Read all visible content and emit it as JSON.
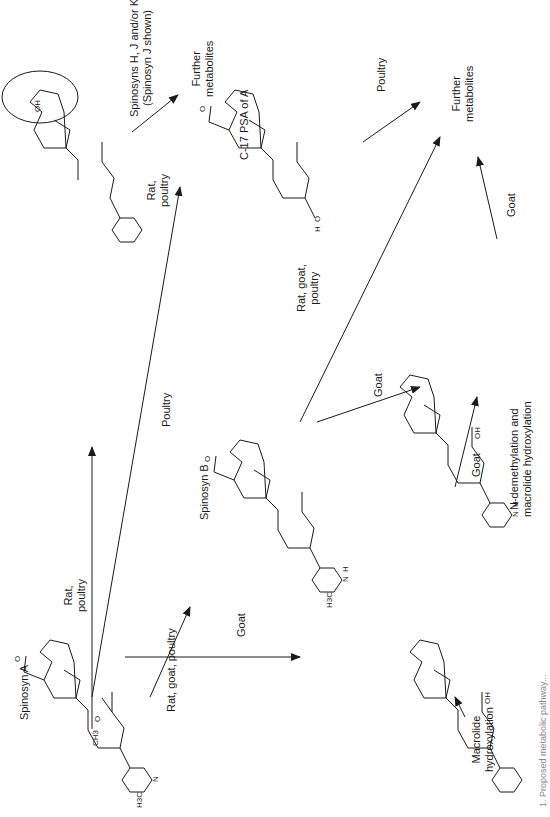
{
  "figure": {
    "orientation": "rotated 90 degrees counter-clockwise",
    "compounds": [
      {
        "id": "spinosyn_a",
        "label": "Spinosyn A"
      },
      {
        "id": "spinosyn_b",
        "label": "Spinosyn B"
      },
      {
        "id": "c17_psa",
        "label": "C-17 PSA of A"
      },
      {
        "id": "spinosyn_hjk",
        "label_line1": "Spinosyns H, J and/or K",
        "label_line2": "(Spinosyn J shown)"
      },
      {
        "id": "macrolide_hydroxylated",
        "label_line1": "Macrolide",
        "label_line2": "hydroxylation"
      },
      {
        "id": "n_demethylated_hydroxylated",
        "label_line1": "N-demethylation and",
        "label_line2": "macrolide hydroxylation"
      }
    ],
    "endpoints": [
      {
        "id": "further_top",
        "line1": "Further",
        "line2": "metabolites"
      },
      {
        "id": "further_right",
        "line1": "Further",
        "line2": "metabolites"
      }
    ],
    "transitions": [
      {
        "from": "spinosyn_a",
        "to": "spinosyn_hjk",
        "line1": "Rat,",
        "line2": "poultry"
      },
      {
        "from": "spinosyn_a",
        "to": "c17_psa",
        "line1": "Poultry",
        "line2": ""
      },
      {
        "from": "spinosyn_a",
        "to": "spinosyn_b",
        "line1": "Rat, goat, poultry",
        "line2": ""
      },
      {
        "from": "spinosyn_a",
        "to": "macrolide_hydroxylated",
        "line1": "Goat",
        "line2": ""
      },
      {
        "from": "spinosyn_hjk",
        "to": "further_top",
        "line1": "Rat,",
        "line2": "poultry"
      },
      {
        "from": "c17_psa",
        "to": "further_right",
        "line1": "Poultry",
        "line2": ""
      },
      {
        "from": "spinosyn_b",
        "to": "further_right",
        "line1": "Rat, goat,",
        "line2": "poultry"
      },
      {
        "from": "spinosyn_b",
        "to": "n_demethylated_hydroxylated",
        "line1": "Goat",
        "line2": ""
      },
      {
        "from": "macrolide_hydroxylated",
        "to": "n_demethylated_hydroxylated",
        "line1": "Goat",
        "line2": ""
      },
      {
        "from": "n_demethylated_hydroxylated",
        "to": "further_right",
        "line1": "Goat",
        "line2": ""
      }
    ],
    "atom_labels": {
      "och3": "OCH3",
      "ch3": "CH3",
      "oh": "OH",
      "h3c": "H3C",
      "n": "N",
      "o": "O",
      "h": "H"
    },
    "caption_partial": "1. Proposed metabolic pathway..."
  }
}
